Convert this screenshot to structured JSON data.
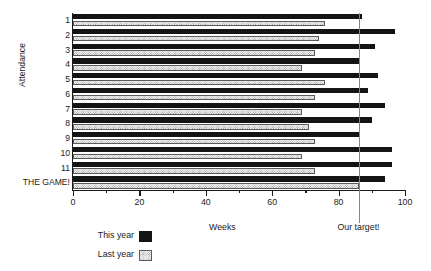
{
  "chart_data": {
    "type": "bar",
    "orientation": "horizontal",
    "title": "",
    "xlabel": "Weeks",
    "ylabel": "Attendance",
    "xlim": [
      0,
      100
    ],
    "xticks": [
      0,
      20,
      40,
      60,
      80,
      100
    ],
    "xtick_labels": [
      "0",
      "20",
      "40",
      "60",
      "80",
      "100"
    ],
    "minor_xticks": [
      10,
      30,
      50,
      70,
      90
    ],
    "grid": false,
    "legend_position": "bottom-left",
    "categories": [
      "1",
      "2",
      "3",
      "4",
      "5",
      "6",
      "7",
      "8",
      "9",
      "10",
      "11",
      "THE GAME!"
    ],
    "series": [
      {
        "name": "This year",
        "style": "solid-black",
        "color": "#141414",
        "values": [
          87,
          97,
          91,
          86,
          92,
          89,
          94,
          90,
          86,
          96,
          96,
          94
        ]
      },
      {
        "name": "Last year",
        "style": "dotted-light",
        "color": "#f2f2f2",
        "values": [
          76,
          74,
          73,
          69,
          76,
          73,
          69,
          71,
          73,
          69,
          73,
          86
        ]
      }
    ],
    "annotations": [
      {
        "name": "target-line",
        "label": "Our target!",
        "value": 86,
        "color": "#868686"
      }
    ]
  },
  "legend": {
    "items": [
      {
        "label": "This year"
      },
      {
        "label": "Last year"
      }
    ]
  }
}
